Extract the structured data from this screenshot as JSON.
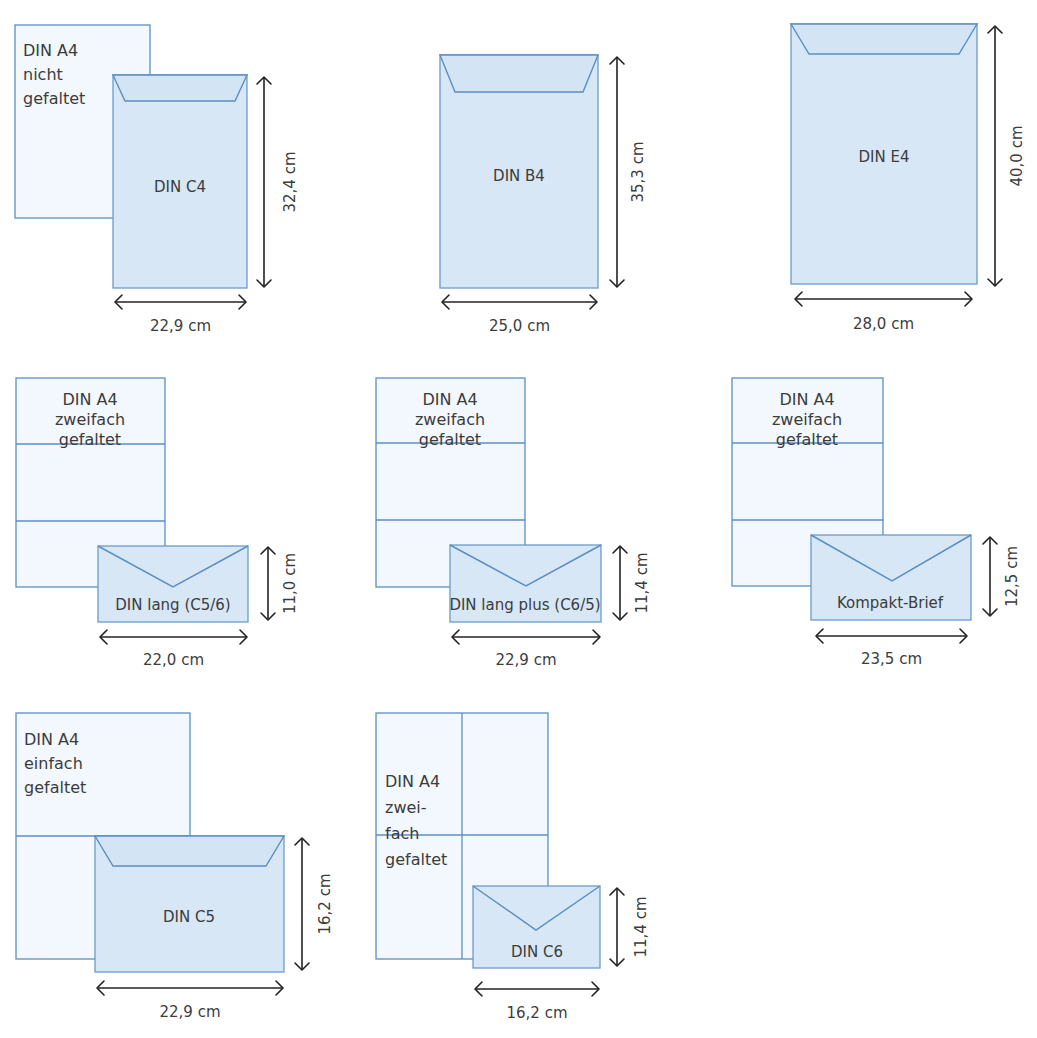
{
  "figure": {
    "colors": {
      "sheet_fill": "#f2f8fd",
      "sheet_stroke": "#5b8fc2",
      "envelope_fill": "#d7e7f6",
      "envelope_stroke": "#6a9bcb",
      "text": "#3c3c3c",
      "dimension": "#222222"
    }
  },
  "panels": [
    {
      "id": "c4",
      "sheet": {
        "label_lines": [
          "DIN A4",
          "nicht",
          "gefaltet"
        ],
        "x": 15,
        "y": 25,
        "w": 135,
        "h": 193,
        "label_align": "left",
        "label_x": 23,
        "label_y": 48,
        "line_h": 24,
        "folds_h": [],
        "folds_v": []
      },
      "envelope": {
        "name": "DIN C4",
        "x": 113,
        "y": 75,
        "w": 134,
        "h": 213,
        "flap": "trapezoid",
        "flap_depth": 26,
        "flap_inset": 12,
        "label_x": 180,
        "label_y": 192
      },
      "width_dim": {
        "value": "22,9 cm",
        "x1": 115,
        "x2": 246,
        "y": 302,
        "label_y": 331
      },
      "height_dim": {
        "value": "32,4 cm",
        "x": 264,
        "y1": 77,
        "y2": 287,
        "label_x": 295
      }
    },
    {
      "id": "b4",
      "sheet": null,
      "envelope": {
        "name": "DIN B4",
        "x": 440,
        "y": 55,
        "w": 158,
        "h": 233,
        "flap": "trapezoid",
        "flap_depth": 37,
        "flap_inset": 15,
        "label_x": 519,
        "label_y": 181
      },
      "width_dim": {
        "value": "25,0 cm",
        "x1": 442,
        "x2": 597,
        "y": 302,
        "label_y": 331
      },
      "height_dim": {
        "value": "35,3 cm",
        "x": 617,
        "y1": 57,
        "y2": 287,
        "label_x": 643
      }
    },
    {
      "id": "e4",
      "sheet": null,
      "envelope": {
        "name": "DIN E4",
        "x": 791,
        "y": 24,
        "w": 186,
        "h": 260,
        "flap": "trapezoid",
        "flap_depth": 30,
        "flap_inset": 18,
        "label_x": 884,
        "label_y": 162
      },
      "width_dim": {
        "value": "28,0 cm",
        "x1": 795,
        "x2": 972,
        "y": 299,
        "label_y": 329
      },
      "height_dim": {
        "value": "40,0 cm",
        "x": 995,
        "y1": 26,
        "y2": 286,
        "label_x": 1022
      }
    },
    {
      "id": "din-lang",
      "sheet": {
        "label_lines": [
          "DIN A4",
          "zweifach",
          "gefaltet"
        ],
        "x": 16,
        "y": 378,
        "w": 149,
        "h": 209,
        "label_align": "center",
        "label_x": 90,
        "label_y": 397,
        "line_h": 20,
        "folds_h": [
          444,
          521
        ],
        "folds_v": []
      },
      "envelope": {
        "name": "DIN lang (C5/6)",
        "x": 98,
        "y": 546,
        "w": 150,
        "h": 76,
        "flap": "v",
        "apex_x": 173,
        "apex_y": 587,
        "label_x": 173,
        "label_y": 610
      },
      "width_dim": {
        "value": "22,0 cm",
        "x1": 100,
        "x2": 247,
        "y": 637,
        "label_y": 665
      },
      "height_dim": {
        "value": "11,0 cm",
        "x": 268,
        "y1": 547,
        "y2": 620,
        "label_x": 295
      }
    },
    {
      "id": "din-lang-plus",
      "sheet": {
        "label_lines": [
          "DIN A4",
          "zweifach",
          "gefaltet"
        ],
        "x": 376,
        "y": 378,
        "w": 149,
        "h": 209,
        "label_align": "center",
        "label_x": 450,
        "label_y": 397,
        "line_h": 20,
        "folds_h": [
          443,
          520
        ],
        "folds_v": []
      },
      "envelope": {
        "name": "DIN lang plus (C6/5)",
        "x": 450,
        "y": 545,
        "w": 151,
        "h": 77,
        "flap": "v",
        "apex_x": 526,
        "apex_y": 586,
        "label_x": 525,
        "label_y": 610
      },
      "width_dim": {
        "value": "22,9 cm",
        "x1": 452,
        "x2": 600,
        "y": 637,
        "label_y": 665
      },
      "height_dim": {
        "value": "11,4 cm",
        "x": 620,
        "y1": 546,
        "y2": 620,
        "label_x": 647
      }
    },
    {
      "id": "kompakt",
      "sheet": {
        "label_lines": [
          "DIN A4",
          "zweifach",
          "gefaltet"
        ],
        "x": 732,
        "y": 378,
        "w": 151,
        "h": 208,
        "label_align": "center",
        "label_x": 807,
        "label_y": 397,
        "line_h": 20,
        "folds_h": [
          443,
          520
        ],
        "folds_v": []
      },
      "envelope": {
        "name": "Kompakt-Brief",
        "x": 811,
        "y": 535,
        "w": 160,
        "h": 85,
        "flap": "v",
        "apex_x": 892,
        "apex_y": 581,
        "label_x": 890,
        "label_y": 608
      },
      "width_dim": {
        "value": "23,5 cm",
        "x1": 816,
        "x2": 967,
        "y": 636,
        "label_y": 664
      },
      "height_dim": {
        "value": "12,5 cm",
        "x": 990,
        "y1": 537,
        "y2": 616,
        "label_x": 1017
      }
    },
    {
      "id": "c5",
      "sheet": {
        "label_lines": [
          "DIN A4",
          "einfach",
          "gefaltet"
        ],
        "x": 16,
        "y": 713,
        "w": 174,
        "h": 246,
        "label_align": "left",
        "label_x": 24,
        "label_y": 737,
        "line_h": 24,
        "folds_h": [
          836
        ],
        "folds_v": []
      },
      "envelope": {
        "name": "DIN C5",
        "x": 95,
        "y": 836,
        "w": 189,
        "h": 136,
        "flap": "trapezoid",
        "flap_depth": 30,
        "flap_inset": 18,
        "label_x": 189,
        "label_y": 922
      },
      "width_dim": {
        "value": "22,9 cm",
        "x1": 97,
        "x2": 283,
        "y": 988,
        "label_y": 1017
      },
      "height_dim": {
        "value": "16,2 cm",
        "x": 302,
        "y1": 838,
        "y2": 970,
        "label_x": 330
      }
    },
    {
      "id": "c6",
      "sheet": {
        "label_lines": [
          "DIN A4",
          "zwei-",
          "fach",
          "gefaltet"
        ],
        "x": 376,
        "y": 713,
        "w": 172,
        "h": 246,
        "label_align": "left",
        "label_x": 385,
        "label_y": 779,
        "line_h": 26,
        "folds_h": [
          835
        ],
        "folds_v": [
          462
        ]
      },
      "envelope": {
        "name": "DIN C6",
        "x": 473,
        "y": 886,
        "w": 127,
        "h": 82,
        "flap": "v",
        "apex_x": 536,
        "apex_y": 930,
        "label_x": 537,
        "label_y": 957
      },
      "width_dim": {
        "value": "16,2 cm",
        "x1": 475,
        "x2": 599,
        "y": 989,
        "label_y": 1018
      },
      "height_dim": {
        "value": "11,4 cm",
        "x": 617,
        "y1": 888,
        "y2": 966,
        "label_x": 646
      }
    }
  ]
}
